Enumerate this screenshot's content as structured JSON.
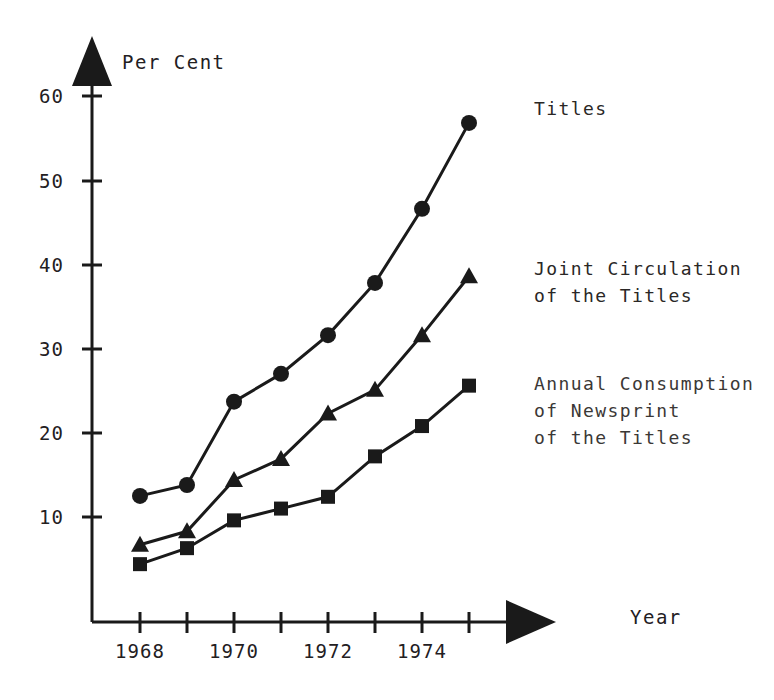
{
  "axes": {
    "y_title": "Per Cent",
    "x_title": "Year",
    "y_ticks": [
      "10",
      "20",
      "30",
      "40",
      "50",
      "60"
    ],
    "x_ticks": [
      "1968",
      "1970",
      "1972",
      "1974"
    ]
  },
  "series_labels": {
    "titles": "Titles",
    "circulation": "Joint Circulation\nof the Titles",
    "newsprint": "Annual Consumption\nof Newsprint\nof the Titles"
  },
  "chart_data": {
    "type": "line",
    "title": "",
    "xlabel": "Year",
    "ylabel": "Per Cent",
    "xlim": [
      1967.5,
      1975.5
    ],
    "ylim": [
      0,
      63
    ],
    "grid": false,
    "legend_position": "right-inline",
    "x": [
      1968,
      1969,
      1970,
      1971,
      1972,
      1973,
      1974,
      1975
    ],
    "series": [
      {
        "name": "Titles",
        "marker": "circle",
        "values": [
          12.5,
          13.8,
          23.7,
          27.0,
          31.6,
          37.8,
          46.6,
          56.8
        ]
      },
      {
        "name": "Joint Circulation of the Titles",
        "marker": "triangle",
        "values": [
          6.7,
          8.3,
          14.4,
          16.9,
          22.3,
          25.1,
          31.6,
          38.6
        ]
      },
      {
        "name": "Annual Consumption of Newsprint of the Titles",
        "marker": "square",
        "values": [
          4.4,
          6.3,
          9.6,
          11.0,
          12.4,
          17.2,
          20.8,
          25.6
        ]
      }
    ]
  },
  "colors": {
    "ink": "#1a1a1a",
    "background": "#ffffff"
  }
}
